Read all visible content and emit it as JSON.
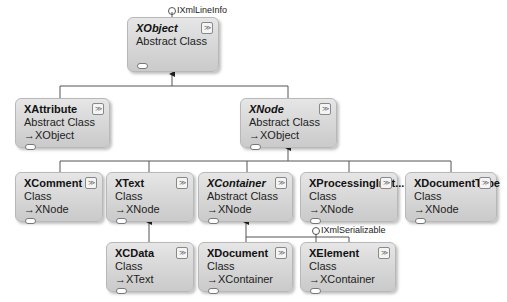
{
  "diagram": {
    "interfaces": [
      {
        "id": "ixmllineinfo",
        "label": "IXmlLineInfo"
      },
      {
        "id": "ixmlserializable",
        "label": "IXmlSerializable"
      }
    ],
    "classes": {
      "xobject": {
        "name": "XObject",
        "kind": "Abstract Class",
        "base": ""
      },
      "xattribute": {
        "name": "XAttribute",
        "kind": "Abstract Class",
        "base": "XObject"
      },
      "xnode": {
        "name": "XNode",
        "kind": "Abstract Class",
        "base": "XObject"
      },
      "xcomment": {
        "name": "XComment",
        "kind": "Class",
        "base": "XNode"
      },
      "xtext": {
        "name": "XText",
        "kind": "Class",
        "base": "XNode"
      },
      "xcontainer": {
        "name": "XContainer",
        "kind": "Abstract Class",
        "base": "XNode"
      },
      "xprocessinginst": {
        "name": "XProcessingInst...",
        "kind": "Class",
        "base": "XNode"
      },
      "xdocumenttype": {
        "name": "XDocumentType",
        "kind": "Class",
        "base": "XNode"
      },
      "xcdata": {
        "name": "XCData",
        "kind": "Class",
        "base": "XText"
      },
      "xdocument": {
        "name": "XDocument",
        "kind": "Class",
        "base": "XContainer"
      },
      "xelement": {
        "name": "XElement",
        "kind": "Class",
        "base": "XContainer"
      }
    },
    "icons": {
      "collapse": "≫",
      "base_arrow": "→"
    }
  }
}
